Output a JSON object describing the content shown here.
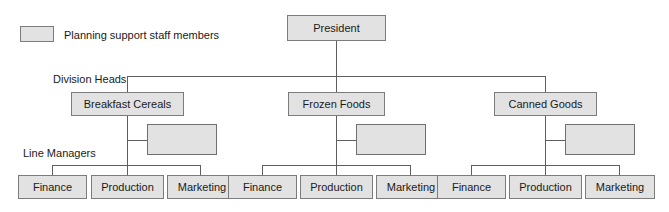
{
  "legend": {
    "swatch_name": "planning-staff-swatch",
    "text": "Planning support staff members"
  },
  "tier_labels": {
    "division_heads": "Division Heads",
    "line_managers": "Line Managers"
  },
  "top": {
    "label": "President"
  },
  "divisions": [
    {
      "label": "Breakfast Cereals",
      "staff_label": "",
      "managers": [
        "Finance",
        "Production",
        "Marketing"
      ]
    },
    {
      "label": "Frozen Foods",
      "staff_label": "",
      "managers": [
        "Finance",
        "Production",
        "Marketing"
      ]
    },
    {
      "label": "Canned Goods",
      "staff_label": "",
      "managers": [
        "Finance",
        "Production",
        "Marketing"
      ]
    }
  ],
  "colors": {
    "box_fill": "#e2e2e2",
    "box_border": "#7c7c7c",
    "line": "#5e5e5e",
    "text": "#1a1a1a",
    "background": "#ffffff"
  }
}
